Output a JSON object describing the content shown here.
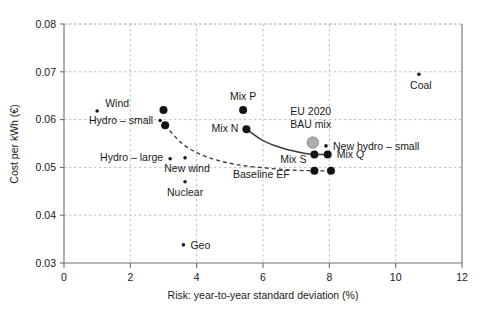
{
  "chart_data": {
    "type": "scatter",
    "title": "",
    "xlabel": "Risk: year-to-year standard deviation (%)",
    "ylabel": "Cost per kWh (€)",
    "xlim": [
      0,
      12
    ],
    "ylim": [
      0.03,
      0.08
    ],
    "xticks": [
      "0",
      "2",
      "4",
      "6",
      "8",
      "10",
      "12"
    ],
    "xtick_values": [
      0,
      2,
      4,
      6,
      8,
      10,
      12
    ],
    "yticks": [
      "0.03",
      "0.04",
      "0.05",
      "0.06",
      "0.07",
      "0.08"
    ],
    "ytick_values": [
      0.03,
      0.04,
      0.05,
      0.06,
      0.07,
      0.08
    ],
    "grid": true,
    "legend": "none",
    "points": [
      {
        "label": "Wind",
        "x": 1.0,
        "y": 0.0618,
        "marker": "small",
        "label_dx": 8,
        "label_dy": -4,
        "anchor": "start"
      },
      {
        "label": "Hydro – small",
        "x": 2.9,
        "y": 0.0598,
        "marker": "small",
        "label_dx": -7,
        "label_dy": 3,
        "anchor": "end"
      },
      {
        "label": "Hydro – large",
        "x": 3.2,
        "y": 0.0518,
        "marker": "small",
        "label_dx": -7,
        "label_dy": 2,
        "anchor": "end"
      },
      {
        "label": "New wind",
        "x": 3.65,
        "y": 0.052,
        "marker": "small",
        "label_dx": 2,
        "label_dy": 14,
        "anchor": "middle"
      },
      {
        "label": "Nuclear",
        "x": 3.65,
        "y": 0.047,
        "marker": "small",
        "label_dx": 0,
        "label_dy": 14,
        "anchor": "middle"
      },
      {
        "label": "Geo",
        "x": 3.6,
        "y": 0.0338,
        "marker": "small",
        "label_dx": 7,
        "label_dy": 4,
        "anchor": "start"
      },
      {
        "label": "Coal",
        "x": 10.7,
        "y": 0.0695,
        "marker": "small",
        "label_dx": 2,
        "label_dy": 15,
        "anchor": "middle"
      },
      {
        "label": "New hydro – small",
        "x": 7.9,
        "y": 0.0545,
        "marker": "small",
        "label_dx": 7,
        "label_dy": 4,
        "anchor": "start"
      },
      {
        "label": "Mix P",
        "x": 5.4,
        "y": 0.062,
        "marker": "big",
        "label_dx": 0,
        "label_dy": -10,
        "anchor": "middle"
      },
      {
        "label": "Mix N",
        "x": 5.5,
        "y": 0.058,
        "marker": "big",
        "label_dx": -8,
        "label_dy": 3,
        "anchor": "end"
      },
      {
        "label": "Mix S",
        "x": 7.55,
        "y": 0.0527,
        "marker": "big",
        "label_dx": -8,
        "label_dy": 9,
        "anchor": "end"
      },
      {
        "label": "Mix Q",
        "x": 7.95,
        "y": 0.0527,
        "marker": "big",
        "label_dx": 9,
        "label_dy": 4,
        "anchor": "start"
      },
      {
        "label": "",
        "x": 3.0,
        "y": 0.062,
        "marker": "big",
        "label_dx": 0,
        "label_dy": 0,
        "anchor": "middle"
      },
      {
        "label": "",
        "x": 3.05,
        "y": 0.0588,
        "marker": "big",
        "label_dx": 0,
        "label_dy": 0,
        "anchor": "middle"
      },
      {
        "label": "",
        "x": 7.55,
        "y": 0.0493,
        "marker": "big",
        "label_dx": 0,
        "label_dy": 0,
        "anchor": "middle"
      },
      {
        "label": "",
        "x": 8.05,
        "y": 0.0493,
        "marker": "big",
        "label_dx": 0,
        "label_dy": 0,
        "anchor": "middle"
      }
    ],
    "bau_point": {
      "label_line1": "EU 2020",
      "label_line2": "BAU mix",
      "x": 7.5,
      "y": 0.0552,
      "marker": "bau-circle"
    },
    "curves": [
      {
        "name": "mix-frontier-solid",
        "style": "solid",
        "points": [
          [
            5.5,
            0.058
          ],
          [
            6.0,
            0.0556
          ],
          [
            6.6,
            0.054
          ],
          [
            7.2,
            0.053
          ],
          [
            7.55,
            0.0527
          ],
          [
            7.95,
            0.0527
          ]
        ]
      },
      {
        "name": "baseline-ef-dashed",
        "style": "dashed",
        "label": "Baseline EF",
        "points": [
          [
            3.05,
            0.0588
          ],
          [
            3.6,
            0.0548
          ],
          [
            4.3,
            0.0522
          ],
          [
            5.2,
            0.0506
          ],
          [
            6.2,
            0.0498
          ],
          [
            7.0,
            0.0494
          ],
          [
            7.55,
            0.0493
          ],
          [
            8.05,
            0.0493
          ]
        ]
      }
    ],
    "annotations": [
      {
        "text": "Baseline EF",
        "x": 5.95,
        "y": 0.0477
      }
    ]
  }
}
